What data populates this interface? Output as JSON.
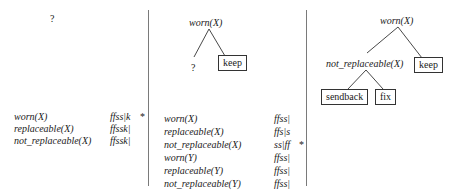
{
  "panels": [
    {
      "tree": {
        "root": "?"
      },
      "rows": [
        {
          "label": "worn(X)",
          "state": "ffss|k"
        },
        {
          "label": "replaceable(X)",
          "state": "ffssk|"
        },
        {
          "label": "not_replaceable(X)",
          "state": "ffssk|"
        }
      ],
      "marker": "*"
    },
    {
      "tree": {
        "root": "worn(X)",
        "left": "?",
        "right": "keep"
      },
      "rows": [
        {
          "label": "worn(X)",
          "state": "ffss|"
        },
        {
          "label": "replaceable(X)",
          "state": "ffs|s"
        },
        {
          "label": "not_replaceable(X)",
          "state": "ss|ff"
        },
        {
          "label": "worn(Y)",
          "state": "ffss|"
        },
        {
          "label": "replaceable(Y)",
          "state": "ffss|"
        },
        {
          "label": "not_replaceable(Y)",
          "state": "ffss|"
        }
      ],
      "marker": "*"
    },
    {
      "tree": {
        "root": "worn(X)",
        "left": "not_replaceable(X)",
        "right": "keep",
        "left_left": "sendback",
        "left_right": "fix"
      }
    }
  ]
}
